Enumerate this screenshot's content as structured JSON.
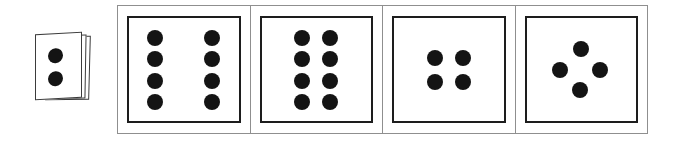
{
  "scene": {
    "width": 675,
    "height": 154,
    "background_color": "#ffffff",
    "dot_color": "#141414",
    "card_border_color": "#1d1d1d",
    "frame_border_color": "#8f8f8f",
    "stack_border_color": "#3b3b3b",
    "description": "Card stack showing two dots beside a framed strip of four dot-pattern cards"
  },
  "card_stack": {
    "name": "two-dot-card-stack",
    "sheet_count": 3,
    "dot_count": 2,
    "dots": [
      {
        "cx": 12,
        "cy": 14,
        "r": 7.5
      },
      {
        "cx": 12,
        "cy": 37,
        "r": 7.5
      }
    ]
  },
  "panels": [
    {
      "name": "panel-eight-dots-wide",
      "dot_count": 8,
      "arrangement": "2 columns x 4 rows, wide spacing",
      "dot_radius": 8,
      "dots": [
        {
          "x": 24,
          "y": 19
        },
        {
          "x": 76,
          "y": 19
        },
        {
          "x": 24,
          "y": 40
        },
        {
          "x": 76,
          "y": 40
        },
        {
          "x": 24,
          "y": 61
        },
        {
          "x": 76,
          "y": 61
        },
        {
          "x": 24,
          "y": 82
        },
        {
          "x": 76,
          "y": 82
        }
      ]
    },
    {
      "name": "panel-eight-dots-narrow",
      "dot_count": 8,
      "arrangement": "2 columns x 4 rows, narrow spacing",
      "dot_radius": 8,
      "dots": [
        {
          "x": 37,
          "y": 19
        },
        {
          "x": 63,
          "y": 19
        },
        {
          "x": 37,
          "y": 40
        },
        {
          "x": 63,
          "y": 40
        },
        {
          "x": 37,
          "y": 61
        },
        {
          "x": 63,
          "y": 61
        },
        {
          "x": 37,
          "y": 82
        },
        {
          "x": 63,
          "y": 82
        }
      ]
    },
    {
      "name": "panel-four-dots-square",
      "dot_count": 4,
      "arrangement": "2 x 2 square",
      "dot_radius": 8,
      "dots": [
        {
          "x": 37,
          "y": 39
        },
        {
          "x": 63,
          "y": 39
        },
        {
          "x": 37,
          "y": 62
        },
        {
          "x": 63,
          "y": 62
        }
      ]
    },
    {
      "name": "panel-four-dots-diamond",
      "dot_count": 4,
      "arrangement": "diamond / rhombus",
      "dot_radius": 8,
      "dots": [
        {
          "x": 50,
          "y": 30
        },
        {
          "x": 31,
          "y": 50
        },
        {
          "x": 67,
          "y": 50
        },
        {
          "x": 49,
          "y": 70
        }
      ]
    }
  ]
}
